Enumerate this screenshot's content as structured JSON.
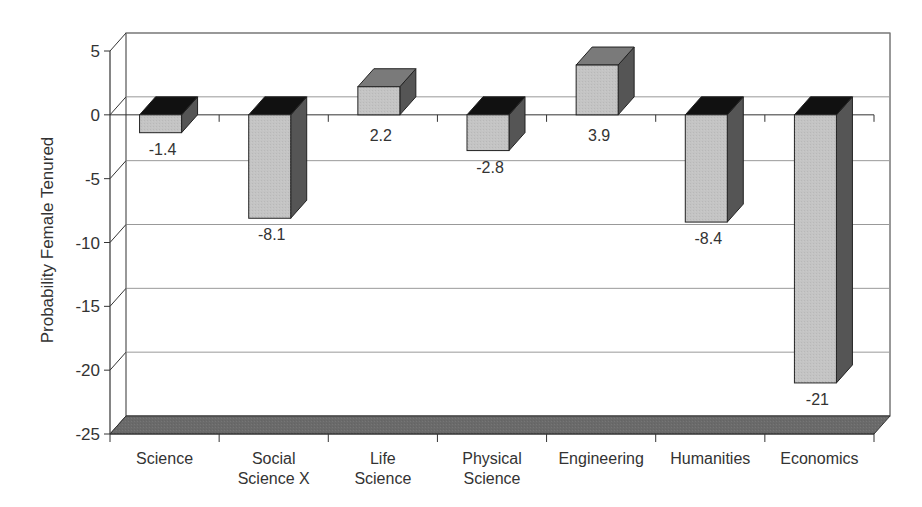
{
  "chart_data": {
    "type": "bar",
    "style": "3d-column",
    "title": "",
    "xlabel": "",
    "ylabel": "Probability Female Tenured",
    "categories": [
      "Science",
      "Social Science X",
      "Life Science",
      "Physical Science",
      "Engineering",
      "Humanities",
      "Economics"
    ],
    "category_lines": [
      [
        "Science"
      ],
      [
        "Social",
        "Science X"
      ],
      [
        "Life",
        "Science"
      ],
      [
        "Physical",
        "Science"
      ],
      [
        "Engineering"
      ],
      [
        "Humanities"
      ],
      [
        "Economics"
      ]
    ],
    "values": [
      -1.4,
      -8.1,
      2.2,
      -2.8,
      3.9,
      -8.4,
      -21
    ],
    "data_labels": [
      "-1.4",
      "-8.1",
      "2.2",
      "-2.8",
      "3.9",
      "-8.4",
      "-21"
    ],
    "ylim": [
      -25,
      5
    ],
    "yticks": [
      5,
      0,
      -5,
      -10,
      -15,
      -20,
      -25
    ],
    "ytick_labels": [
      "5",
      "0",
      "-5",
      "-10",
      "-15",
      "-20",
      "-25"
    ],
    "grid": true,
    "legend": null
  },
  "colors": {
    "bar_front": "#c4c4c4",
    "bar_side": "#555555",
    "bar_top_negative": "#111111",
    "bar_top_positive": "#7a7a7a",
    "floor": "#6a6a6a",
    "gridline": "#999999",
    "axis": "#333333"
  }
}
